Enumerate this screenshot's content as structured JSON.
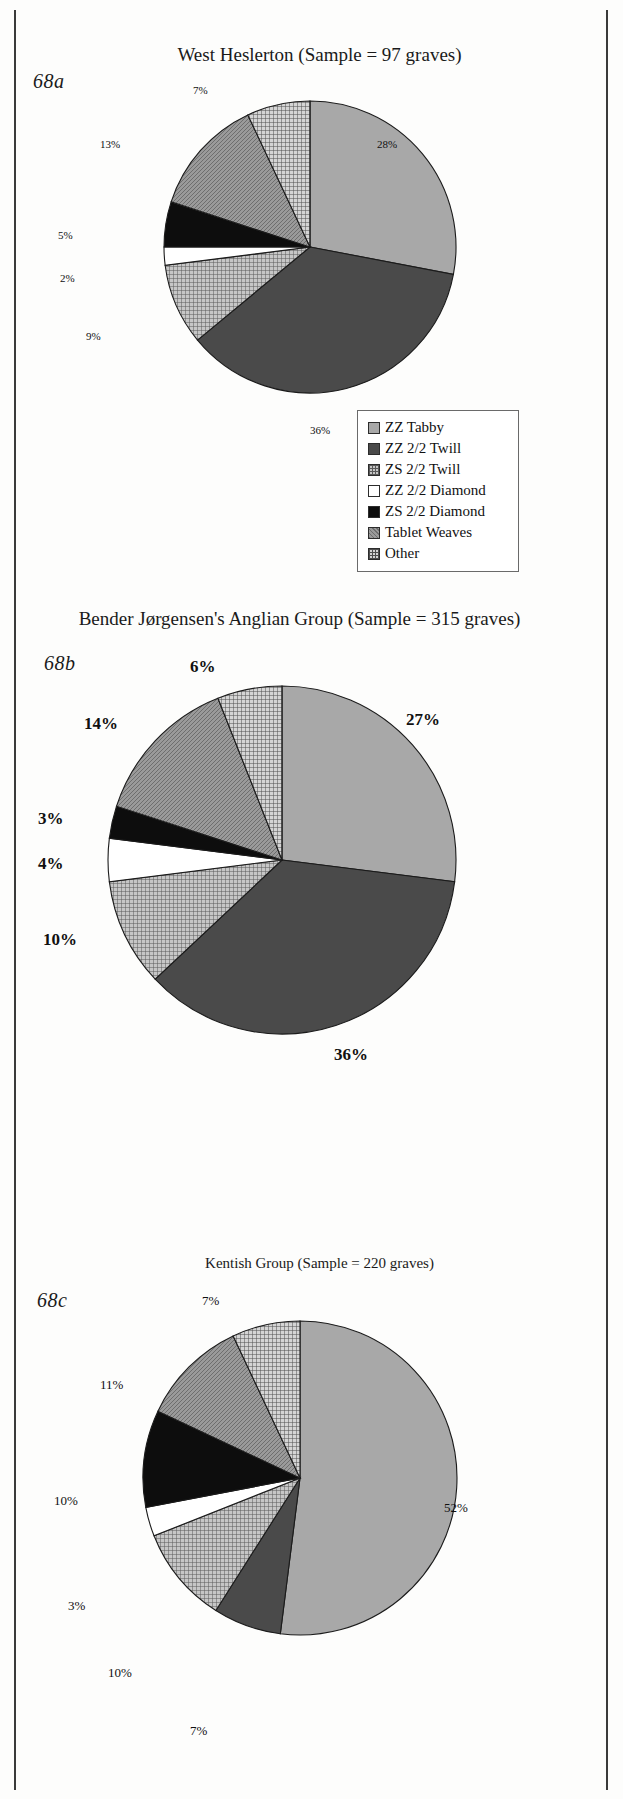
{
  "figure": {
    "panels": [
      {
        "label": "68a",
        "title": "West Heslerton (Sample = 97 graves)"
      },
      {
        "label": "68b",
        "title": "Bender Jørgensen's Anglian Group (Sample = 315 graves)"
      },
      {
        "label": "68c",
        "title": "Kentish Group (Sample = 220 graves)"
      }
    ]
  },
  "legend": {
    "items": [
      {
        "label": "ZZ Tabby",
        "swatch": "flat-light-gray",
        "color": "#a8a8a8"
      },
      {
        "label": "ZZ 2/2 Twill",
        "swatch": "flat-dark-gray",
        "color": "#4a4a4a"
      },
      {
        "label": "ZS 2/2 Twill",
        "swatch": "fine-grid",
        "color": "#c6c6c6"
      },
      {
        "label": "ZZ 2/2 Diamond",
        "swatch": "white",
        "color": "#ffffff"
      },
      {
        "label": "ZS 2/2 Diamond",
        "swatch": "solid-black",
        "color": "#0d0d0d"
      },
      {
        "label": "Tablet Weaves",
        "swatch": "diagonal-hatch",
        "color": "#9a9a9a"
      },
      {
        "label": "Other",
        "swatch": "coarse-grid",
        "color": "#d4d4d4"
      }
    ]
  },
  "chart_data": [
    {
      "type": "pie",
      "title": "West Heslerton (Sample = 97 graves)",
      "panel_label": "68a",
      "sample_size": 97,
      "sample_unit": "graves",
      "categories": [
        "ZZ Tabby",
        "ZZ 2/2 Twill",
        "ZS 2/2 Twill",
        "ZZ 2/2 Diamond",
        "ZS 2/2 Diamond",
        "Tablet Weaves",
        "Other"
      ],
      "values": [
        28,
        36,
        9,
        2,
        5,
        13,
        7
      ],
      "labels": [
        "28%",
        "36%",
        "9%",
        "2%",
        "5%",
        "13%",
        "7%"
      ],
      "unit": "%",
      "legend_position": "right",
      "grid": false
    },
    {
      "type": "pie",
      "title": "Bender Jørgensen's Anglian Group (Sample = 315 graves)",
      "panel_label": "68b",
      "sample_size": 315,
      "sample_unit": "graves",
      "categories": [
        "ZZ Tabby",
        "ZZ 2/2 Twill",
        "ZS 2/2 Twill",
        "ZZ 2/2 Diamond",
        "ZS 2/2 Diamond",
        "Tablet Weaves",
        "Other"
      ],
      "values": [
        27,
        36,
        10,
        4,
        3,
        14,
        6
      ],
      "labels": [
        "27%",
        "36%",
        "10%",
        "4%",
        "3%",
        "14%",
        "6%"
      ],
      "unit": "%",
      "legend_position": "none",
      "grid": false
    },
    {
      "type": "pie",
      "title": "Kentish Group (Sample = 220 graves)",
      "panel_label": "68c",
      "sample_size": 220,
      "sample_unit": "graves",
      "categories": [
        "ZZ Tabby",
        "ZZ 2/2 Twill",
        "ZS 2/2 Twill",
        "ZZ 2/2 Diamond",
        "ZS 2/2 Diamond",
        "Tablet Weaves",
        "Other"
      ],
      "values": [
        52,
        7,
        10,
        3,
        10,
        11,
        7
      ],
      "labels": [
        "52%",
        "7%",
        "10%",
        "3%",
        "10%",
        "11%",
        "7%"
      ],
      "unit": "%",
      "legend_position": "none",
      "grid": false
    }
  ]
}
